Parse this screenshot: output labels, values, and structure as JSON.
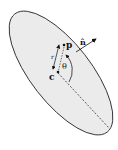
{
  "diagram": {
    "type": "ellipse-geometry",
    "colors": {
      "fill": "#ebebeb",
      "stroke": "#333333",
      "text": "#111111"
    },
    "labels": {
      "center": "c",
      "point": "p",
      "normal": "n̂",
      "angle": "θ",
      "distance": "r"
    }
  }
}
